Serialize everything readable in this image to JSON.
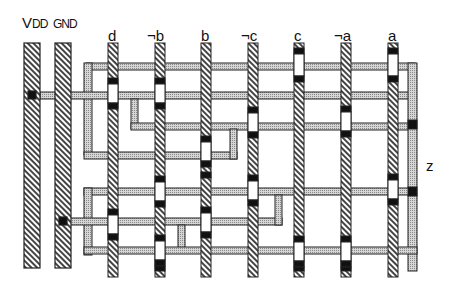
{
  "diagram": {
    "power_rails": [
      {
        "label_main": "V",
        "label_sub": "DD",
        "id": "vdd"
      },
      {
        "label_main": "GND",
        "label_sub": "",
        "id": "gnd"
      }
    ],
    "inputs": [
      "d",
      "¬b",
      "b",
      "¬c",
      "c",
      "¬a",
      "a"
    ],
    "output": "z",
    "colors": {
      "metal_fill": "#c8c8c8",
      "poly_hatch": "#333333",
      "contact": "#111111",
      "gate_gap": "#ffffff",
      "outline": "#222222"
    }
  }
}
